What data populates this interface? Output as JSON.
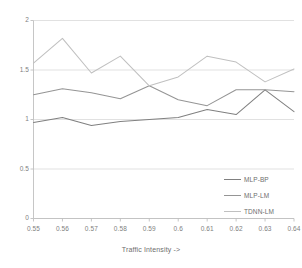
{
  "chart_data": {
    "type": "line",
    "title": "",
    "xlabel": "Traffic Intensity ->",
    "ylabel": "",
    "x": [
      0.55,
      0.56,
      0.57,
      0.58,
      0.59,
      0.6,
      0.61,
      0.62,
      0.63,
      0.64
    ],
    "categories": [
      "0.55",
      "0.56",
      "0.57",
      "0.58",
      "0.59",
      "0.6",
      "0.61",
      "0.62",
      "0.63",
      "0.64"
    ],
    "xlim": [
      0.55,
      0.64
    ],
    "ylim": [
      0,
      2
    ],
    "yticks": [
      0,
      0.5,
      1,
      1.5,
      2
    ],
    "ytick_labels": [
      "0",
      "0.5",
      "1",
      "1.5",
      "2"
    ],
    "grid": "horizontal",
    "legend_position": "bottom-right",
    "series": [
      {
        "name": "MLP-BP",
        "color": "#808080",
        "values": [
          0.97,
          1.02,
          0.94,
          0.98,
          1.0,
          1.02,
          1.1,
          1.05,
          1.3,
          1.08
        ]
      },
      {
        "name": "MLP-LM",
        "color": "#959595",
        "values": [
          1.25,
          1.31,
          1.27,
          1.21,
          1.34,
          1.2,
          1.14,
          1.3,
          1.3,
          1.28
        ]
      },
      {
        "name": "TDNN-LM",
        "color": "#c0c0c0",
        "values": [
          1.57,
          1.82,
          1.47,
          1.64,
          1.34,
          1.43,
          1.64,
          1.58,
          1.38,
          1.51
        ]
      }
    ]
  },
  "axis": {
    "x_title": "Traffic Intensity ->",
    "y_tick_labels": [
      "2",
      "1.5",
      "1",
      "0.5",
      "0"
    ],
    "x_tick_labels": [
      "0.55",
      "0.56",
      "0.57",
      "0.58",
      "0.59",
      "0.6",
      "0.61",
      "0.62",
      "0.63",
      "0.64"
    ]
  },
  "legend": {
    "items": [
      {
        "label": "MLP-BP",
        "color": "#808080"
      },
      {
        "label": "MLP-LM",
        "color": "#959595"
      },
      {
        "label": "TDNN-LM",
        "color": "#c0c0c0"
      }
    ]
  },
  "colors": {
    "gridline": "#d9d9d9",
    "axis": "#bfbfbf",
    "text": "#808080",
    "background": "#ffffff"
  }
}
